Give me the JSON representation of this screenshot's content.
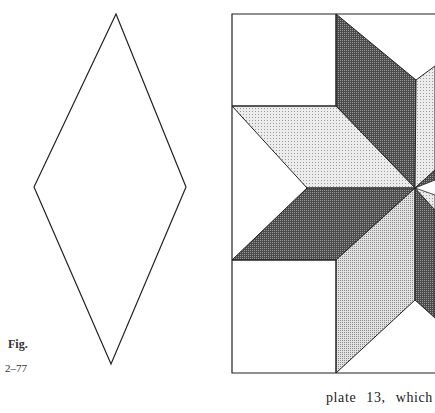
{
  "figure": {
    "label": "Fig.",
    "number": "2–77"
  },
  "body_text": {
    "line1": "plate 13, which"
  },
  "colors": {
    "light_fill": "#d8d8d8",
    "dark_fill": "#5a5a5a",
    "medium_fill": "#bdbdbd",
    "stroke": "#222222"
  },
  "diagrams": {
    "diamond_template": "single diamond (rhombus) pattern outline",
    "quilt_block": "eight-pointed star quilt block with shaded diamonds"
  }
}
